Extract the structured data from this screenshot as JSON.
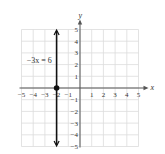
{
  "chart_data": {
    "type": "line",
    "title": "",
    "xlabel": "x",
    "ylabel": "y",
    "xlim": [
      -5,
      5
    ],
    "ylim": [
      -5,
      5
    ],
    "grid": true,
    "x_ticks": [
      "-5",
      "-4",
      "-3",
      "-2",
      "-1",
      "1",
      "2",
      "3",
      "4",
      "5"
    ],
    "y_ticks": [
      "5",
      "4",
      "3",
      "2",
      "1",
      "-1",
      "-2",
      "-3",
      "-4",
      "-5"
    ],
    "series": [
      {
        "name": "-3x = 6",
        "kind": "vertical_line",
        "x": -2,
        "points": [
          {
            "x": -2,
            "y": -5
          },
          {
            "x": -2,
            "y": 5
          }
        ],
        "arrows": "both"
      }
    ],
    "marked_points": [
      {
        "x": -2,
        "y": 0
      }
    ],
    "annotations": [
      {
        "text": "−3x = 6",
        "x": -4.3,
        "y": 2.3
      }
    ]
  },
  "colors": {
    "grid": "#dcdcdc",
    "axis": "#555555",
    "line": "#111111",
    "text": "#333333"
  }
}
